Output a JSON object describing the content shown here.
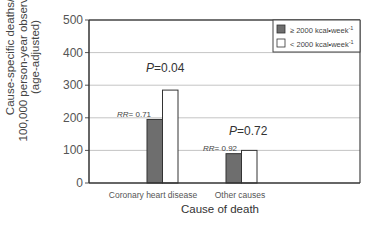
{
  "chart_data": {
    "type": "bar",
    "title": "",
    "xlabel": "Cause of death",
    "ylabel": [
      "Cause-specific deaths/",
      "100,000 person-year observation",
      "(age-adjusted)"
    ],
    "ylim": [
      0,
      500
    ],
    "yticks": [
      0,
      100,
      200,
      300,
      400,
      500
    ],
    "grid": true,
    "legend_position": "upper right",
    "categories": [
      "Coronary heart disease",
      "Other causes"
    ],
    "series": [
      {
        "name": "≥ 2000 kcal•week⁻¹",
        "color": "#6e6e6e",
        "values": [
          195,
          90
        ]
      },
      {
        "name": "< 2000 kcal•week⁻¹",
        "color": "#ffffff",
        "values": [
          285,
          100
        ]
      }
    ],
    "annotations": [
      {
        "category": "Coronary heart disease",
        "p_label": "P",
        "p_value": "=0.04",
        "rr_label": "RR",
        "rr_value": "= 0.71"
      },
      {
        "category": "Other causes",
        "p_label": "P",
        "p_value": "=0.72",
        "rr_label": "RR",
        "rr_value": "= 0.92"
      }
    ]
  },
  "legend": {
    "items": [
      {
        "prefix": "≥ 2000 kcal",
        "unit": "•week",
        "sup": "-1"
      },
      {
        "prefix": "< 2000 kcal",
        "unit": "•week",
        "sup": "-1"
      }
    ]
  }
}
